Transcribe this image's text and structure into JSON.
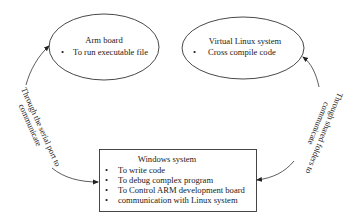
{
  "diagram": {
    "nodes": [
      {
        "id": "arm-board",
        "shape": "ellipse",
        "title": "Arm board",
        "bullets": [
          "To run executable file"
        ]
      },
      {
        "id": "virtual-linux",
        "shape": "ellipse",
        "title": "Virtual Linux system",
        "bullets": [
          "Cross compile code"
        ]
      },
      {
        "id": "windows-system",
        "shape": "rectangle",
        "title": "Windows system",
        "bullets": [
          "To write code",
          "To debug complex program",
          "To Control ARM development board",
          "communication with Linux system"
        ]
      }
    ],
    "edges": [
      {
        "from": "windows-system",
        "to": "arm-board",
        "bidirectional": true,
        "label_line1": "Through the serial port to",
        "label_line2": "communicate"
      },
      {
        "from": "virtual-linux",
        "to": "windows-system",
        "bidirectional": true,
        "label_line1": "Through shared folders to",
        "label_line2": "communicate"
      }
    ],
    "bullet_glyph": "•",
    "colors": {
      "stroke": "#333333",
      "text": "#1a1a1a",
      "background": "#ffffff"
    }
  }
}
